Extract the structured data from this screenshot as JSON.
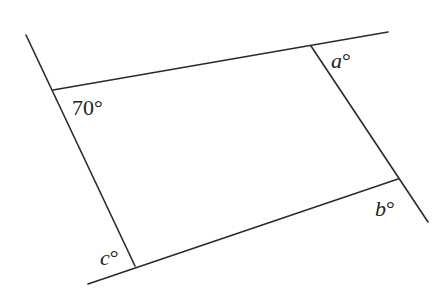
{
  "diagram": {
    "stroke_color": "#2a2a2a",
    "lines": [
      {
        "name": "left-line",
        "x1": 26,
        "y1": 35,
        "x2": 135,
        "y2": 266
      },
      {
        "name": "top-line",
        "x1": 53,
        "y1": 90,
        "x2": 388,
        "y2": 32
      },
      {
        "name": "right-line",
        "x1": 311,
        "y1": 46,
        "x2": 428,
        "y2": 222
      },
      {
        "name": "bottom-line",
        "x1": 88,
        "y1": 284,
        "x2": 398,
        "y2": 179
      }
    ],
    "labels": {
      "angle_70": {
        "value": "70",
        "symbol": "°"
      },
      "angle_a": {
        "var": "a",
        "symbol": "°"
      },
      "angle_b": {
        "var": "b",
        "symbol": "°"
      },
      "angle_c": {
        "var": "c",
        "symbol": "°"
      }
    }
  }
}
